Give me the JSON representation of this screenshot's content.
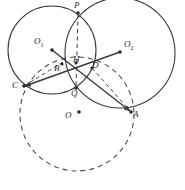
{
  "figure": {
    "type": "geometry-diagram",
    "width": 185,
    "height": 190,
    "background": "#ffffff",
    "stroke_color": "#3a3a3a",
    "dash_color": "#4a4a4a",
    "label_color": "#2a2a2a"
  },
  "points": [
    {
      "id": "P",
      "label": "P",
      "x": 78,
      "y": 13,
      "label_x": 74,
      "label_y": 2,
      "dot": true
    },
    {
      "id": "O1",
      "label": "O",
      "sub": "1",
      "x": 52,
      "y": 50,
      "label_x": 34,
      "label_y": 38,
      "dot": true
    },
    {
      "id": "O2",
      "label": "O",
      "sub": "2",
      "x": 120,
      "y": 52,
      "label_x": 124,
      "label_y": 41,
      "dot": true
    },
    {
      "id": "B",
      "label": "B",
      "x": 62,
      "y": 64,
      "label_x": 56,
      "label_y": 64,
      "dot": true
    },
    {
      "id": "H",
      "label": "H",
      "x": 76,
      "y": 63,
      "label_x": 75,
      "label_y": 57,
      "dot": true
    },
    {
      "id": "D",
      "label": "D",
      "x": 92,
      "y": 68,
      "label_x": 93,
      "label_y": 63,
      "dot": true
    },
    {
      "id": "C",
      "label": "C",
      "x": 24,
      "y": 86,
      "label_x": 13,
      "label_y": 84,
      "dot": true
    },
    {
      "id": "Q",
      "label": "Q",
      "x": 76,
      "y": 88,
      "label_x": 72,
      "label_y": 89,
      "dot": true
    },
    {
      "id": "O",
      "label": "O",
      "x": 79,
      "y": 112,
      "label_x": 66,
      "label_y": 112,
      "dot": true
    },
    {
      "id": "A",
      "label": "A",
      "x": 131,
      "y": 112,
      "label_x": 133,
      "label_y": 111,
      "dot": true
    }
  ],
  "circles": [
    {
      "id": "circle-O1",
      "cx": 52,
      "cy": 50,
      "r": 44,
      "style": "solid",
      "note": "circle centered at O1"
    },
    {
      "id": "circle-O2",
      "cx": 120,
      "cy": 53,
      "r": 55,
      "style": "solid",
      "note": "circle centered at O2"
    },
    {
      "id": "circle-O",
      "cx": 77,
      "cy": 114,
      "r": 57,
      "style": "dashed",
      "note": "circumcircle centered at O"
    }
  ],
  "segments": [
    {
      "id": "seg-O1-A",
      "from": "O1",
      "to": "A",
      "style": "solid",
      "arrow": true,
      "note": "ray from O1 through D to A"
    },
    {
      "id": "seg-O2-C",
      "from": "O2",
      "to": "C",
      "style": "solid",
      "arrow": true,
      "note": "ray from O2 through B to C"
    },
    {
      "id": "seg-P-Q",
      "from": "P",
      "to": "Q",
      "style": "dashed",
      "arrow": false,
      "note": "radical axis PQ through H"
    },
    {
      "id": "seg-D-A",
      "from": "D",
      "to": "A",
      "style": "dashed",
      "arrow": false,
      "note": "chord D to A"
    },
    {
      "id": "seg-C-B",
      "from": "C",
      "to": "B",
      "style": "dashed",
      "arrow": false,
      "note": "chord C to B"
    }
  ],
  "labels": {
    "P": "P",
    "O1": "O",
    "O1_sub": "1",
    "O2": "O",
    "O2_sub": "2",
    "B": "B",
    "H": "H",
    "D": "D",
    "C": "C",
    "Q": "Q",
    "O": "O",
    "A": "A"
  }
}
